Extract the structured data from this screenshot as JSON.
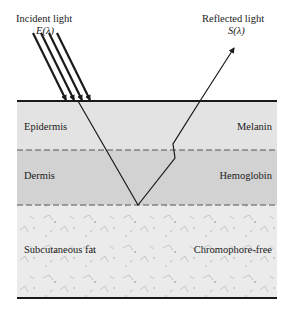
{
  "diagram": {
    "type": "skin-layer-light-path",
    "incident": {
      "title": "Incident light",
      "symbol": "E(λ)"
    },
    "reflected": {
      "title": "Reflected light",
      "symbol": "S(λ)"
    },
    "layers": [
      {
        "name": "Epidermis",
        "chromophore": "Melanin",
        "fill": "#e4e4e4"
      },
      {
        "name": "Dermis",
        "chromophore": "Hemoglobin",
        "fill": "#d3d3d3"
      },
      {
        "name": "Subcutaneous fat",
        "chromophore": "Chromophore-free",
        "fill": "#e8e8e8"
      }
    ],
    "colors": {
      "line": "#1a1a1a",
      "boundary_dashed": "#555555"
    }
  }
}
